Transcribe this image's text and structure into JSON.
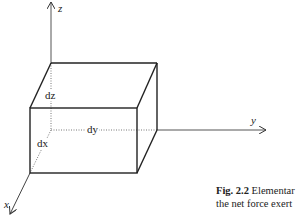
{
  "figure": {
    "axes": {
      "x_label": "x",
      "y_label": "y",
      "z_label": "z"
    },
    "dimensions": {
      "dx": "dx",
      "dy": "dy",
      "dz": "dz"
    },
    "caption": {
      "number": "Fig. 2.2",
      "line1_text": "Elementar",
      "line2_text": "the net force exert"
    }
  }
}
